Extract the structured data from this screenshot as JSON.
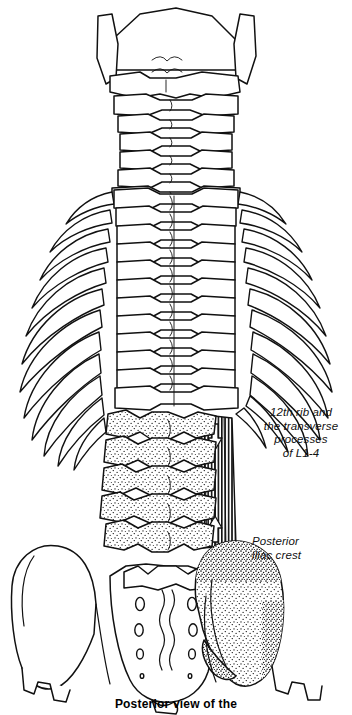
{
  "figure": {
    "caption": "Posterior view of the",
    "background_color": "#ffffff",
    "ink_color": "#111111",
    "view": "posterior"
  },
  "labels": {
    "rib_and_processes": "12th rib and\nthe transverse\nprocesses\nof L1-4",
    "iliac_crest": "Posterior\niliac crest"
  },
  "structures": {
    "skull_base": "occiput",
    "mastoid_left": "left mastoid process",
    "mastoid_right": "right mastoid process",
    "cervical": "cervical vertebrae C1-C7",
    "thoracic": "thoracic vertebrae T1-T12",
    "ribs": "rib cage, 12 pairs",
    "lumbar": "lumbar vertebrae L1-L5",
    "sacrum": "sacrum",
    "ilium_left": "left ilium",
    "ilium_right": "right ilium",
    "muscle": "quadratus lumborum",
    "muscle_shading": "vertical hatching",
    "bone_shading": "stipple"
  },
  "counts": {
    "cervical_vertebrae": 7,
    "thoracic_vertebrae": 12,
    "rib_pairs": 12,
    "lumbar_vertebrae": 5,
    "sacral_foramina_pairs": 4,
    "muscle_direction_arrows": 2
  },
  "arrows": {
    "upper": "down",
    "lower": "up"
  }
}
